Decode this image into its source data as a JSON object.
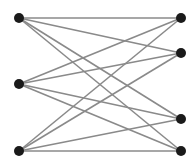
{
  "diagram": {
    "type": "complete-bipartite-graph",
    "name": "K3,4",
    "colors": {
      "background": "#ffffff",
      "node": "#1a1a1a",
      "edge": "#8a8a8a"
    },
    "node_radius": 5,
    "edge_width": 1.6,
    "nodes": [
      {
        "id": "L1",
        "group": "left",
        "x": 19,
        "y": 18
      },
      {
        "id": "L2",
        "group": "left",
        "x": 19,
        "y": 84
      },
      {
        "id": "L3",
        "group": "left",
        "x": 19,
        "y": 151
      },
      {
        "id": "R1",
        "group": "right",
        "x": 181,
        "y": 18
      },
      {
        "id": "R2",
        "group": "right",
        "x": 181,
        "y": 53
      },
      {
        "id": "R3",
        "group": "right",
        "x": 181,
        "y": 119
      },
      {
        "id": "R4",
        "group": "right",
        "x": 181,
        "y": 151
      }
    ],
    "edges": [
      [
        "L1",
        "R1"
      ],
      [
        "L1",
        "R2"
      ],
      [
        "L1",
        "R3"
      ],
      [
        "L1",
        "R4"
      ],
      [
        "L2",
        "R1"
      ],
      [
        "L2",
        "R2"
      ],
      [
        "L2",
        "R3"
      ],
      [
        "L2",
        "R4"
      ],
      [
        "L3",
        "R1"
      ],
      [
        "L3",
        "R2"
      ],
      [
        "L3",
        "R3"
      ],
      [
        "L3",
        "R4"
      ]
    ]
  }
}
